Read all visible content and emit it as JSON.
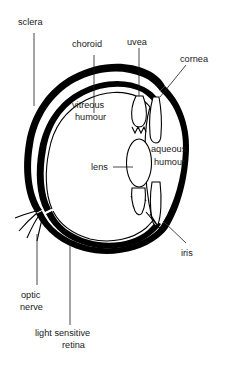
{
  "diagram": {
    "colors": {
      "background": "#ffffff",
      "ink": "#000000",
      "label_text": "#1a1a1a"
    },
    "labels": {
      "sclera": "sclera",
      "choroid": "choroid",
      "uvea": "uvea",
      "cornea": "cornea",
      "vitreous_humour_line1": "vitreous",
      "vitreous_humour_line2": "humour",
      "aqueous_humour_line1": "aqueous",
      "aqueous_humour_line2": "humour",
      "lens": "lens",
      "iris": "iris",
      "optic_nerve_line1": "optic",
      "optic_nerve_line2": "nerve",
      "retina_line1": "light sensitive",
      "retina_line2": "retina"
    },
    "parts": [
      "sclera",
      "choroid",
      "uvea",
      "cornea",
      "vitreous humour",
      "aqueous humour",
      "lens",
      "iris",
      "optic nerve",
      "light sensitive retina"
    ]
  }
}
